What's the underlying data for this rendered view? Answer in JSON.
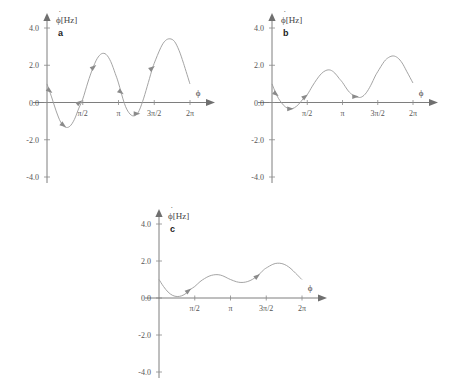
{
  "figure": {
    "background_color": "#ffffff",
    "curve_color": "#9a9a9a",
    "axis_color": "#6f6f6f",
    "text_color": "#555555"
  },
  "panels": [
    {
      "letter": "a",
      "x": 0,
      "y": 0,
      "w": 228,
      "h": 195,
      "chart_data": {
        "type": "line",
        "title": "",
        "xlabel": "ϕ",
        "ylabel": "ϕ̇[Hz]",
        "ylabel_parts": {
          "symbol": "ϕ",
          "dot": "˙",
          "unit": "[Hz]"
        },
        "xlim": [
          0,
          6.2832
        ],
        "ylim": [
          -4.0,
          4.0
        ],
        "yticks": [
          4.0,
          2.0,
          0.0,
          -2.0,
          -4.0
        ],
        "ytick_labels": [
          "4.0",
          "2.0",
          "0.0",
          "-2.0",
          "-4.0"
        ],
        "xticks": [
          1.5708,
          3.1416,
          4.7124,
          6.2832
        ],
        "xtick_labels": [
          "π/2",
          "π",
          "3π/2",
          "2π"
        ],
        "grid": false,
        "legend": "none",
        "series": [
          {
            "name": "phase velocity a",
            "x": [
              0.0,
              0.2,
              0.4,
              0.6,
              0.8,
              1.0,
              1.2,
              1.4,
              1.57,
              1.8,
              2.0,
              2.2,
              2.4,
              2.6,
              2.8,
              3.0,
              3.14,
              3.4,
              3.6,
              3.8,
              4.0,
              4.2,
              4.4,
              4.6,
              4.71,
              5.0,
              5.2,
              5.4,
              5.6,
              5.8,
              6.0,
              6.28
            ],
            "y": [
              1.0,
              0.3,
              -0.45,
              -1.05,
              -1.32,
              -1.28,
              -0.92,
              -0.3,
              0.18,
              1.1,
              1.8,
              2.35,
              2.62,
              2.58,
              2.2,
              1.55,
              1.05,
              -0.05,
              -0.55,
              -0.72,
              -0.55,
              0.05,
              0.85,
              1.7,
              2.1,
              2.95,
              3.32,
              3.42,
              3.28,
              2.8,
              2.1,
              1.0
            ]
          }
        ],
        "flow_arrows": [
          {
            "x": 0.12,
            "y": 0.62,
            "dir": "down-right"
          },
          {
            "x": 0.72,
            "y": -1.22,
            "dir": "down-right"
          },
          {
            "x": 1.42,
            "y": 0.0,
            "dir": "up-right"
          },
          {
            "x": 2.05,
            "y": 1.9,
            "dir": "up-right"
          },
          {
            "x": 3.25,
            "y": 0.55,
            "dir": "down-right"
          },
          {
            "x": 3.95,
            "y": -0.6,
            "dir": "right"
          },
          {
            "x": 4.62,
            "y": 1.85,
            "dir": "up-right"
          }
        ]
      }
    },
    {
      "letter": "b",
      "x": 225,
      "y": 0,
      "w": 226,
      "h": 195,
      "chart_data": {
        "type": "line",
        "title": "",
        "xlabel": "ϕ",
        "ylabel": "ϕ̇[Hz]",
        "ylabel_parts": {
          "symbol": "ϕ",
          "dot": "˙",
          "unit": "[Hz]"
        },
        "xlim": [
          0,
          6.2832
        ],
        "ylim": [
          -4.0,
          4.0
        ],
        "yticks": [
          4.0,
          2.0,
          0.0,
          -2.0,
          -4.0
        ],
        "ytick_labels": [
          "4.0",
          "2.0",
          "0.0",
          "-2.0",
          "-4.0"
        ],
        "xticks": [
          1.5708,
          3.1416,
          4.7124,
          6.2832
        ],
        "xtick_labels": [
          "π/2",
          "π",
          "3π/2",
          "2π"
        ],
        "grid": false,
        "legend": "none",
        "series": [
          {
            "name": "phase velocity b",
            "x": [
              0.0,
              0.2,
              0.4,
              0.6,
              0.8,
              1.0,
              1.2,
              1.4,
              1.57,
              1.8,
              2.0,
              2.2,
              2.4,
              2.6,
              2.8,
              3.0,
              3.14,
              3.4,
              3.6,
              3.8,
              4.0,
              4.2,
              4.4,
              4.6,
              4.71,
              5.0,
              5.2,
              5.4,
              5.6,
              5.8,
              6.0,
              6.28
            ],
            "y": [
              1.0,
              0.42,
              0.02,
              -0.24,
              -0.34,
              -0.28,
              -0.08,
              0.22,
              0.42,
              0.88,
              1.25,
              1.55,
              1.72,
              1.74,
              1.58,
              1.28,
              1.08,
              0.62,
              0.4,
              0.28,
              0.3,
              0.52,
              0.92,
              1.42,
              1.65,
              2.2,
              2.42,
              2.5,
              2.4,
              2.12,
              1.68,
              1.05
            ]
          }
        ],
        "flow_arrows": [
          {
            "x": 0.18,
            "y": 0.45,
            "dir": "down-right"
          },
          {
            "x": 0.82,
            "y": -0.34,
            "dir": "right"
          },
          {
            "x": 1.48,
            "y": 0.32,
            "dir": "up-right"
          },
          {
            "x": 3.72,
            "y": 0.32,
            "dir": "right"
          }
        ]
      }
    },
    {
      "letter": "c",
      "x": 112,
      "y": 196,
      "w": 228,
      "h": 194,
      "chart_data": {
        "type": "line",
        "title": "",
        "xlabel": "ϕ",
        "ylabel": "ϕ̇[Hz]",
        "ylabel_parts": {
          "symbol": "ϕ",
          "dot": "˙",
          "unit": "[Hz]"
        },
        "xlim": [
          0,
          6.2832
        ],
        "ylim": [
          -4.0,
          4.0
        ],
        "yticks": [
          4.0,
          2.0,
          0.0,
          -2.0,
          -4.0
        ],
        "ytick_labels": [
          "4.0",
          "2.0",
          "0.0",
          "-2.0",
          "-4.0"
        ],
        "xticks": [
          1.5708,
          3.1416,
          4.7124,
          6.2832
        ],
        "xtick_labels": [
          "π/2",
          "π",
          "3π/2",
          "2π"
        ],
        "grid": false,
        "legend": "none",
        "series": [
          {
            "name": "phase velocity c",
            "x": [
              0.0,
              0.2,
              0.4,
              0.6,
              0.8,
              1.0,
              1.2,
              1.4,
              1.57,
              1.8,
              2.0,
              2.2,
              2.4,
              2.6,
              2.8,
              3.0,
              3.14,
              3.4,
              3.6,
              3.8,
              4.0,
              4.2,
              4.4,
              4.6,
              4.71,
              5.0,
              5.2,
              5.4,
              5.6,
              5.8,
              6.0,
              6.28
            ],
            "y": [
              1.0,
              0.62,
              0.32,
              0.14,
              0.08,
              0.12,
              0.26,
              0.48,
              0.62,
              0.88,
              1.05,
              1.18,
              1.25,
              1.26,
              1.2,
              1.08,
              1.0,
              0.88,
              0.84,
              0.86,
              0.94,
              1.08,
              1.28,
              1.52,
              1.62,
              1.82,
              1.88,
              1.86,
              1.76,
              1.58,
              1.34,
              1.0
            ]
          }
        ],
        "flow_arrows": [
          {
            "x": 1.3,
            "y": 0.4,
            "dir": "up-right"
          },
          {
            "x": 4.32,
            "y": 1.18,
            "dir": "up-right"
          }
        ]
      }
    }
  ]
}
